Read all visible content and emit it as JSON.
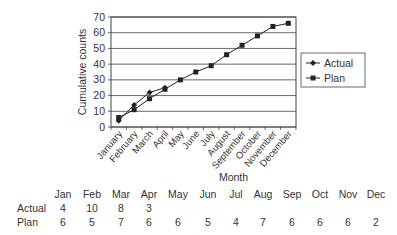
{
  "chart_data": {
    "type": "line",
    "title": "",
    "xlabel": "Month",
    "ylabel": "Cumulative counts",
    "ylim": [
      0,
      70
    ],
    "yticks": [
      0,
      10,
      20,
      30,
      40,
      50,
      60,
      70
    ],
    "grid": true,
    "legend_position": "right",
    "categories": [
      "January",
      "February",
      "March",
      "April",
      "May",
      "June",
      "July",
      "August",
      "September",
      "October",
      "November",
      "December"
    ],
    "series": [
      {
        "name": "Actual",
        "marker": "diamond",
        "values": [
          4,
          14,
          22,
          25,
          null,
          null,
          null,
          null,
          null,
          null,
          null,
          null
        ]
      },
      {
        "name": "Plan",
        "marker": "square",
        "values": [
          6,
          11,
          18,
          24,
          30,
          35,
          39,
          46,
          52,
          58,
          64,
          66
        ]
      }
    ]
  },
  "table": {
    "headers": [
      "Jan",
      "Feb",
      "Mar",
      "Apr",
      "May",
      "Jun",
      "Jul",
      "Aug",
      "Sep",
      "Oct",
      "Nov",
      "Dec"
    ],
    "rows": [
      {
        "label": "Actual",
        "values": [
          "4",
          "10",
          "8",
          "3",
          "",
          "",
          "",
          "",
          "",
          "",
          "",
          ""
        ]
      },
      {
        "label": "Plan",
        "values": [
          "6",
          "5",
          "7",
          "6",
          "6",
          "5",
          "4",
          "7",
          "6",
          "6",
          "6",
          "2"
        ]
      }
    ]
  },
  "colors": {
    "line": "#222222",
    "grid": "#333333",
    "text": "#333333"
  }
}
